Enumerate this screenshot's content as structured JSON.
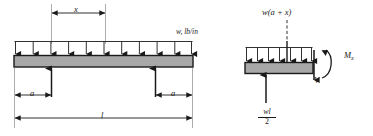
{
  "figure": {
    "type": "engineering-beam-diagram",
    "background": "#ffffff",
    "ink_color": "#1a1a1a",
    "beam_fill": "#a8a8a8",
    "beam_edge": "#1a1a1a"
  },
  "left_diagram": {
    "name": "simply-supported-beam-with-overhangs",
    "distributed_load_label": "w, lb/in",
    "dimension_x": "x",
    "dimension_a_left": "a",
    "dimension_a_right": "a",
    "dimension_l": "l",
    "load_arrow_count": 11,
    "support_count": 2
  },
  "right_diagram": {
    "name": "free-body-diagram-cut-section",
    "resultant_load_label": "w(a + x)",
    "moment_label_base": "M",
    "moment_label_sub": "x",
    "shear_label": "V",
    "reaction_numerator": "wl",
    "reaction_denominator": "2",
    "load_arrow_count": 7
  }
}
